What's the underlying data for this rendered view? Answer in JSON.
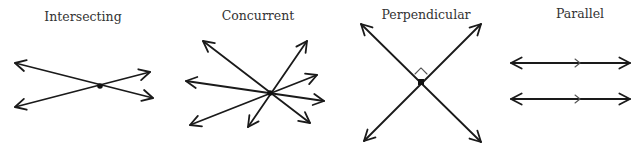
{
  "diagrams": [
    {
      "title": "Intersecting",
      "title_pos": [
        83,
        21
      ],
      "point": [
        100,
        86
      ],
      "rays": [
        [
          15,
          63
        ],
        [
          15,
          107
        ],
        [
          150,
          72
        ],
        [
          153,
          98
        ]
      ],
      "lines": [
        [
          [
            15,
            63
          ],
          [
            153,
            98
          ]
        ],
        [
          [
            15,
            107
          ],
          [
            150,
            72
          ]
        ]
      ]
    },
    {
      "title": "Concurrent",
      "title_pos": [
        258,
        20
      ],
      "point": [
        270,
        93
      ],
      "lines": [
        [
          [
            203,
            41
          ],
          [
            310,
            123
          ]
        ],
        [
          [
            186,
            81
          ],
          [
            324,
            101
          ]
        ],
        [
          [
            190,
            125
          ],
          [
            317,
            75
          ]
        ],
        [
          [
            248,
            127
          ],
          [
            307,
            41
          ]
        ]
      ]
    },
    {
      "title": "Perpendicular",
      "title_pos": [
        426,
        19
      ],
      "point": [
        421,
        82
      ],
      "right_angle_marker": true,
      "lines": [
        [
          [
            361,
            24
          ],
          [
            481,
            142
          ]
        ],
        [
          [
            364,
            141
          ],
          [
            481,
            24
          ]
        ]
      ]
    },
    {
      "title": "Parallel",
      "title_pos": [
        580,
        18
      ],
      "parallel_marks": true,
      "lines": [
        [
          [
            511,
            63
          ],
          [
            630,
            63
          ]
        ],
        [
          [
            511,
            99
          ],
          [
            630,
            99
          ]
        ]
      ]
    }
  ],
  "colors": {
    "stroke": "#1a1a1a",
    "text": "#333333",
    "background": "#ffffff"
  }
}
